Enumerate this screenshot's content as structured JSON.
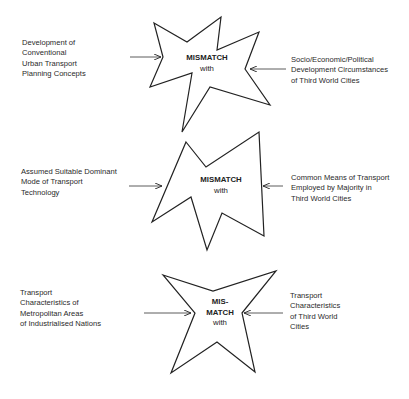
{
  "diagram": {
    "rows": [
      {
        "left_text": [
          "Development of",
          "Conventional",
          "Urban Transport",
          "Planning Concepts"
        ],
        "center_text": [
          "MISMATCH"
        ],
        "center_sub": "with",
        "right_text": [
          "Socio/Economic/Political",
          "Development Circumstances",
          "of Third World Cities"
        ]
      },
      {
        "left_text": [
          "Assumed Suitable Dominant",
          "Mode of Transport",
          "Technology"
        ],
        "center_text": [
          "MISMATCH"
        ],
        "center_sub": "with",
        "right_text": [
          "Common Means of Transport",
          "Employed by Majority in",
          "Third World Cities"
        ]
      },
      {
        "left_text": [
          "Transport",
          "Characteristics of",
          "Metropolitan Areas",
          "of Industrialised Nations"
        ],
        "center_text": [
          "MIS-",
          "MATCH"
        ],
        "center_sub": "with",
        "right_text": [
          "Transport",
          "Characteristics",
          "of Third World",
          "Cities"
        ]
      }
    ],
    "colors": {
      "stroke": "#222222",
      "background": "#ffffff",
      "text": "#2a2a2a"
    }
  }
}
